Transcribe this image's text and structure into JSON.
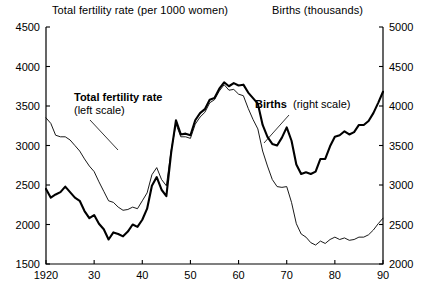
{
  "header": {
    "left_title": "Total fertility rate (per 1000 women)",
    "right_title": "Births (thousands)"
  },
  "annotations": {
    "fertility_bold": "Total fertility rate",
    "fertility_sub": "(left scale)",
    "births_bold": "Births",
    "births_sub": "(right scale)"
  },
  "chart_data": {
    "type": "line",
    "title": "",
    "xlabel": "",
    "ylabel": "Total fertility rate (per 1000 women)",
    "y2label": "Births (thousands)",
    "grid": false,
    "legend": "inline-annotations",
    "xlim": [
      1920,
      1990
    ],
    "xticks": [
      1920,
      1930,
      1940,
      1950,
      1960,
      1970,
      1980,
      1990
    ],
    "xtick_labels": [
      "1920",
      "30",
      "40",
      "50",
      "60",
      "70",
      "80",
      "90"
    ],
    "ylim": [
      1500,
      4500
    ],
    "yticks": [
      1500,
      2000,
      2500,
      3000,
      3500,
      4000,
      4500
    ],
    "ytick_labels": [
      "1500",
      "2000",
      "2500",
      "3000",
      "3500",
      "4000",
      "4500"
    ],
    "y2lim": [
      2000,
      5000
    ],
    "y2ticks": [
      2000,
      2500,
      3000,
      3500,
      4000,
      4500,
      5000
    ],
    "y2tick_labels": [
      "2000",
      "2500",
      "3000",
      "3500",
      "4000",
      "4500",
      "5000"
    ],
    "x": [
      1920,
      1921,
      1922,
      1923,
      1924,
      1925,
      1926,
      1927,
      1928,
      1929,
      1930,
      1931,
      1932,
      1933,
      1934,
      1935,
      1936,
      1937,
      1938,
      1939,
      1940,
      1941,
      1942,
      1943,
      1944,
      1945,
      1946,
      1947,
      1948,
      1949,
      1950,
      1951,
      1952,
      1953,
      1954,
      1955,
      1956,
      1957,
      1958,
      1959,
      1960,
      1961,
      1962,
      1963,
      1964,
      1965,
      1966,
      1967,
      1968,
      1969,
      1970,
      1971,
      1972,
      1973,
      1974,
      1975,
      1976,
      1977,
      1978,
      1979,
      1980,
      1981,
      1982,
      1983,
      1984,
      1985,
      1986,
      1987,
      1988,
      1989,
      1990
    ],
    "series": [
      {
        "name": "Total fertility rate",
        "axis": "left",
        "units": "per 1000 women",
        "style": "thin",
        "values": [
          3350,
          3280,
          3130,
          3110,
          3110,
          3070,
          3000,
          2930,
          2830,
          2740,
          2670,
          2540,
          2420,
          2300,
          2280,
          2220,
          2180,
          2190,
          2220,
          2200,
          2300,
          2400,
          2630,
          2720,
          2570,
          2490,
          2940,
          3270,
          3110,
          3110,
          3090,
          3270,
          3360,
          3420,
          3540,
          3580,
          3690,
          3770,
          3700,
          3710,
          3650,
          3630,
          3470,
          3330,
          3210,
          2930,
          2740,
          2570,
          2480,
          2470,
          2480,
          2280,
          2010,
          1880,
          1840,
          1770,
          1740,
          1790,
          1760,
          1810,
          1840,
          1810,
          1830,
          1800,
          1810,
          1840,
          1840,
          1870,
          1930,
          2010,
          2080
        ]
      },
      {
        "name": "Births",
        "axis": "right",
        "units": "thousands",
        "style": "thick",
        "values": [
          2950,
          2840,
          2880,
          2910,
          2980,
          2910,
          2840,
          2800,
          2670,
          2580,
          2620,
          2510,
          2440,
          2310,
          2400,
          2380,
          2350,
          2410,
          2500,
          2470,
          2560,
          2700,
          2990,
          3100,
          2940,
          2860,
          3410,
          3820,
          3640,
          3650,
          3630,
          3820,
          3910,
          3960,
          4080,
          4100,
          4220,
          4300,
          4250,
          4290,
          4260,
          4270,
          4170,
          4100,
          4030,
          3760,
          3610,
          3520,
          3500,
          3600,
          3730,
          3560,
          3260,
          3140,
          3160,
          3140,
          3170,
          3330,
          3330,
          3490,
          3610,
          3630,
          3680,
          3640,
          3670,
          3760,
          3760,
          3810,
          3910,
          4040,
          4180
        ]
      }
    ]
  }
}
